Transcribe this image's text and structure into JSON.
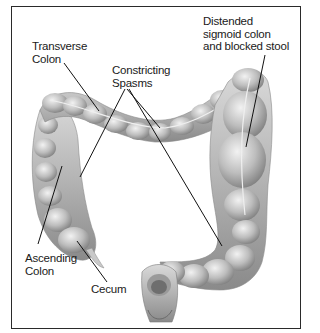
{
  "diagram": {
    "labels": {
      "transverse_colon": "Transverse\nColon",
      "constricting_spasms": "Constricting\nSpasms",
      "distended_sigmoid": "Distended\nsigmoid colon\nand blocked stool",
      "ascending_colon": "Ascending\nColon",
      "cecum": "Cecum"
    },
    "colors": {
      "border": "#2a2a2a",
      "text": "#1a1a1a",
      "tissue_light": "#e6e6e6",
      "tissue_mid": "#b5b5b5",
      "tissue_dark": "#7a7a7a"
    }
  }
}
